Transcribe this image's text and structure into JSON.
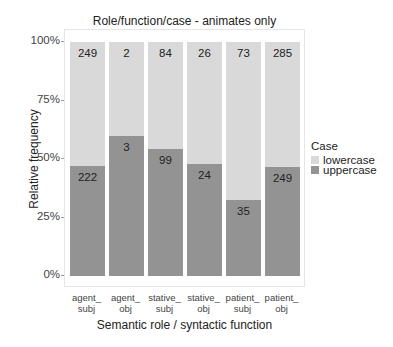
{
  "chart": {
    "title": "Role/function/case - animates only",
    "xlabel": "Semantic role / syntactic function",
    "ylabel": "Relative frequency",
    "yticks": [
      "100%",
      "75%",
      "50%",
      "25%",
      "0%"
    ],
    "xticks": [
      {
        "line1": "agent_",
        "line2": "subj"
      },
      {
        "line1": "agent_",
        "line2": "obj"
      },
      {
        "line1": "stative_",
        "line2": "subj"
      },
      {
        "line1": "stative_",
        "line2": "obj"
      },
      {
        "line1": "patient_",
        "line2": "subj"
      },
      {
        "line1": "patient_",
        "line2": "obj"
      }
    ],
    "legend": {
      "title": "Case",
      "items": [
        {
          "label": "lowercase",
          "color": "#d9d9d9"
        },
        {
          "label": "uppercase",
          "color": "#939393"
        }
      ]
    }
  },
  "chart_data": {
    "type": "bar",
    "stacked": true,
    "normalized": true,
    "title": "Role/function/case - animates only",
    "xlabel": "Semantic role / syntactic function",
    "ylabel": "Relative frequency",
    "ylim": [
      0,
      1
    ],
    "yticks": [
      "0%",
      "25%",
      "50%",
      "75%",
      "100%"
    ],
    "categories": [
      "agent_subj",
      "agent_obj",
      "stative_subj",
      "stative_obj",
      "patient_subj",
      "patient_obj"
    ],
    "series": [
      {
        "name": "lowercase",
        "color": "#d9d9d9",
        "counts": [
          249,
          2,
          84,
          26,
          73,
          285
        ]
      },
      {
        "name": "uppercase",
        "color": "#939393",
        "counts": [
          222,
          3,
          99,
          24,
          35,
          249
        ]
      }
    ],
    "uppercase_share": [
      0.471,
      0.6,
      0.541,
      0.48,
      0.324,
      0.466
    ],
    "legend_title": "Case",
    "legend_position": "right",
    "grid": false
  }
}
